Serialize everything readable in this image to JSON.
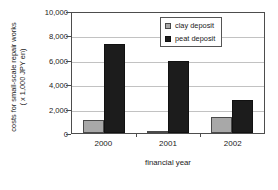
{
  "chart_data": {
    "type": "bar",
    "title": "",
    "categories": [
      "2000",
      "2001",
      "2002"
    ],
    "series": [
      {
        "name": "clay deposit",
        "values": [
          1050,
          200,
          1300
        ],
        "color": "#a8a8a8"
      },
      {
        "name": "peat deposit",
        "values": [
          7300,
          5900,
          2700
        ],
        "color": "#1c1c1c"
      }
    ],
    "xlabel": "financial year",
    "ylabel_line1": "costs for small-scale repair works",
    "ylabel_line2": "( x 1,000 JPY en)",
    "ylim": [
      0,
      10000
    ],
    "yticks": [
      0,
      2000,
      4000,
      6000,
      8000,
      10000
    ],
    "ytick_labels": [
      "0",
      "2,000",
      "4,000",
      "6,000",
      "8,000",
      "10,000"
    ],
    "grid": true,
    "legend_position": "top-right"
  }
}
